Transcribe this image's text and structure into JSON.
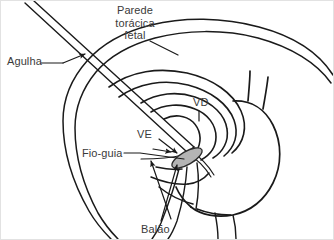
{
  "figure": {
    "background_color": "#ffffff",
    "border_color": "#e2e2e2",
    "line_color": "#1a1a1a",
    "text_color": "#3a3a3a",
    "balloon_fill_color": "#b4b4b4"
  },
  "labels": {
    "chest_wall": {
      "line1": "Parede",
      "line2": "torácica",
      "line3": "fetal"
    },
    "needle": "Agulha",
    "right_ventricle": "VD",
    "left_ventricle": "VE",
    "guidewire": "Fio-guia",
    "balloon": "Balão"
  },
  "icons": {
    "needle_arrow": "arrow-right-icon",
    "ve_arrow": "arrow-right-icon",
    "balloon_arrow": "arrow-up-icon"
  }
}
